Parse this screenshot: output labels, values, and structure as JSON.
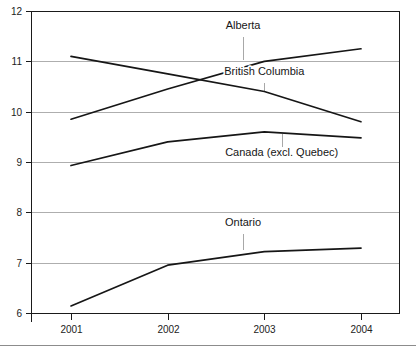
{
  "chart_data": {
    "type": "line",
    "title": "",
    "subtitle": "",
    "xlabel": "",
    "ylabel": "",
    "categories": [
      "2001",
      "2002",
      "2003",
      "2004"
    ],
    "x": [
      2001,
      2002,
      2003,
      2004
    ],
    "ylim": [
      6,
      12
    ],
    "yticks": [
      6,
      7,
      8,
      9,
      10,
      11,
      12
    ],
    "ytick_labels": [
      "6",
      "7",
      "8",
      "9",
      "10",
      "11",
      "12"
    ],
    "xtick_labels": [
      "2001",
      "2002",
      "2003",
      "2004"
    ],
    "grid": true,
    "grid_axis": "y",
    "legend": "inline-labels",
    "legend_position": "inside-plot",
    "line_color": "#161616",
    "grid_color": "#9a9a9a",
    "border_color": "#1a1a1a",
    "series": [
      {
        "name": "British Columbia",
        "values": [
          11.1,
          10.75,
          10.4,
          9.8
        ],
        "label": "British Columbia",
        "label_x": 2003.0,
        "label_y": 10.72,
        "leader": true,
        "leader_from_y": 10.56,
        "leader_to_y": 10.4
      },
      {
        "name": "Alberta",
        "values": [
          9.85,
          10.45,
          11.0,
          11.25
        ],
        "label": "Alberta",
        "label_x": 2002.78,
        "label_y": 11.65,
        "leader": true,
        "leader_from_y": 11.48,
        "leader_to_y": 11.03
      },
      {
        "name": "Canada (excl. Quebec)",
        "values": [
          8.93,
          9.4,
          9.6,
          9.48
        ],
        "label": "Canada (excl. Quebec)",
        "label_x": 2003.18,
        "label_y": 9.12,
        "leader": true,
        "leader_from_y": 9.3,
        "leader_to_y": 9.55
      },
      {
        "name": "Ontario",
        "values": [
          6.14,
          6.95,
          7.22,
          7.29
        ],
        "label": "Ontario",
        "label_x": 2002.78,
        "label_y": 7.72,
        "leader": true,
        "leader_from_y": 7.56,
        "leader_to_y": 7.25
      }
    ]
  },
  "axes": {
    "y_ticks": [
      {
        "label": "12",
        "value": 12
      },
      {
        "label": "11",
        "value": 11
      },
      {
        "label": "10",
        "value": 10
      },
      {
        "label": "9",
        "value": 9
      },
      {
        "label": "8",
        "value": 8
      },
      {
        "label": "7",
        "value": 7
      },
      {
        "label": "6",
        "value": 6
      }
    ],
    "x_ticks": [
      {
        "label": "2001",
        "value": 2001
      },
      {
        "label": "2002",
        "value": 2002
      },
      {
        "label": "2003",
        "value": 2003
      },
      {
        "label": "2004",
        "value": 2004
      }
    ]
  }
}
